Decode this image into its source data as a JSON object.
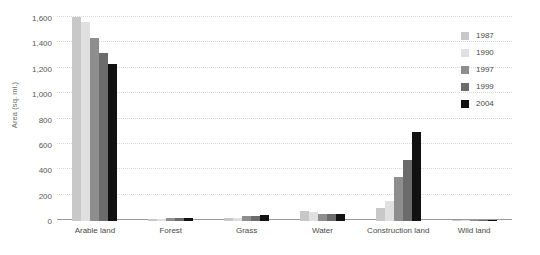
{
  "chart_data": {
    "type": "bar",
    "title": "",
    "xlabel": "",
    "ylabel": "Area (sq. mi.)",
    "ylim": [
      0,
      1600
    ],
    "yticks": [
      "0",
      "200",
      "400",
      "600",
      "800",
      "1,000",
      "1,200",
      "1,400",
      "1,600"
    ],
    "ytick_values": [
      0,
      200,
      400,
      600,
      800,
      1000,
      1200,
      1400,
      1600
    ],
    "grid": true,
    "legend_position": "right",
    "categories": [
      "Arable land",
      "Forest",
      "Grass",
      "Water",
      "Construction land",
      "Wild land"
    ],
    "series": [
      {
        "name": "1987",
        "color": "#c8c8c8",
        "values": [
          1605,
          12,
          20,
          75,
          105,
          10
        ]
      },
      {
        "name": "1990",
        "color": "#e0e0e0",
        "values": [
          1570,
          16,
          26,
          72,
          160,
          9
        ]
      },
      {
        "name": "1997",
        "color": "#8e8e8e",
        "values": [
          1445,
          22,
          38,
          55,
          345,
          7
        ]
      },
      {
        "name": "1999",
        "color": "#6b6b6b",
        "values": [
          1325,
          20,
          40,
          52,
          480,
          6
        ]
      },
      {
        "name": "2004",
        "color": "#111111",
        "values": [
          1235,
          26,
          45,
          55,
          705,
          5
        ]
      }
    ]
  },
  "legend": {
    "items": [
      {
        "label": "1987",
        "color": "#c8c8c8"
      },
      {
        "label": "1990",
        "color": "#e0e0e0"
      },
      {
        "label": "1997",
        "color": "#8e8e8e"
      },
      {
        "label": "1999",
        "color": "#6b6b6b"
      },
      {
        "label": "2004",
        "color": "#111111"
      }
    ]
  },
  "colors": {
    "background": "#ffffff",
    "gridline": "#d8d8d8",
    "axis": "#9a9a9a",
    "tick_text": "#4a4a4a",
    "axis_title": "#6d6d6d"
  }
}
